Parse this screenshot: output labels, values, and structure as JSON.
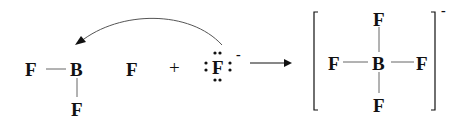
{
  "reactant1": {
    "atoms": {
      "f_left": "F",
      "b": "B",
      "f_right": "F",
      "f_bottom": "F"
    }
  },
  "plus": "+",
  "reactant2": {
    "atom": "F",
    "charge": "-",
    "lone_pairs": 4
  },
  "reaction_arrow": "→",
  "product": {
    "atoms": {
      "f_top": "F",
      "f_left": "F",
      "b": "B",
      "f_right": "F",
      "f_bottom": "F"
    },
    "charge": "-"
  },
  "colors": {
    "ink": "#111111",
    "bond": "#666666"
  }
}
